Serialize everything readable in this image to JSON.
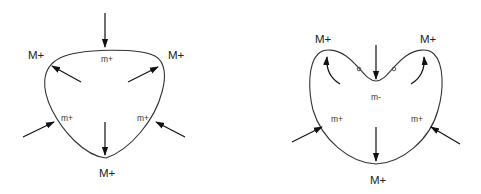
{
  "diagram": {
    "left_shape": {
      "description": "convex rounded triangle",
      "labels": {
        "vertex_top_left": "M+",
        "vertex_top_right": "M+",
        "vertex_bottom": "M+",
        "side_top": "m+",
        "side_left": "m+",
        "side_right": "m+"
      },
      "arrows": [
        {
          "name": "top-inward",
          "direction": "down"
        },
        {
          "name": "inner-to-top-left",
          "direction": "up-left"
        },
        {
          "name": "inner-to-top-right",
          "direction": "up-right"
        },
        {
          "name": "bottom-outward",
          "direction": "down"
        },
        {
          "name": "left-inward",
          "direction": "up-right"
        },
        {
          "name": "right-inward",
          "direction": "up-left"
        }
      ]
    },
    "right_shape": {
      "description": "heart-like shape with concave top",
      "labels": {
        "vertex_top_left": "M+",
        "vertex_top_right": "M+",
        "vertex_bottom": "M+",
        "dip_center": "m-",
        "side_left": "m+",
        "side_right": "m+"
      },
      "inflection_points": 2,
      "arrows": [
        {
          "name": "top-inward",
          "direction": "down"
        },
        {
          "name": "curved-to-top-left",
          "direction": "up"
        },
        {
          "name": "curved-to-top-right",
          "direction": "up"
        },
        {
          "name": "bottom-outward",
          "direction": "down"
        },
        {
          "name": "left-inward",
          "direction": "up-right"
        },
        {
          "name": "right-inward",
          "direction": "up-left"
        }
      ]
    },
    "colors": {
      "stroke": "#333333",
      "arrow": "#111111",
      "background": "#ffffff"
    }
  }
}
